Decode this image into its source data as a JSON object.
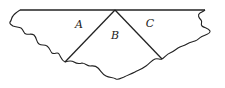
{
  "diagram": {
    "type": "region-partition",
    "stroke_color": "#222222",
    "background": "#ffffff",
    "regions": [
      {
        "id": "A",
        "label": "A",
        "position": "left"
      },
      {
        "id": "B",
        "label": "B",
        "position": "center"
      },
      {
        "id": "C",
        "label": "C",
        "position": "right"
      }
    ],
    "apex": {
      "x": 115,
      "y": 10
    },
    "dividers": [
      {
        "from": "apex",
        "to": {
          "x": 65,
          "y": 62
        },
        "separates": [
          "A",
          "B"
        ]
      },
      {
        "from": "apex",
        "to": {
          "x": 162,
          "y": 59
        },
        "separates": [
          "B",
          "C"
        ]
      }
    ]
  },
  "labels": {
    "a": "A",
    "b": "B",
    "c": "C"
  }
}
